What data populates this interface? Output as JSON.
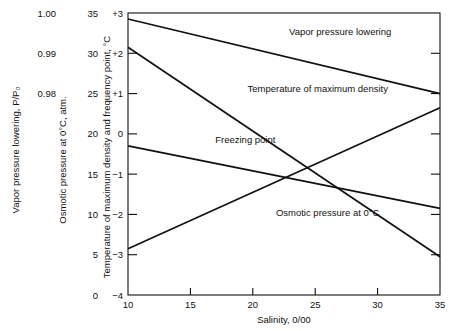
{
  "chart_data": {
    "type": "line",
    "title": "",
    "xlabel": "Salinity, 0/00",
    "xlim": [
      10,
      35
    ],
    "xticks": [
      10,
      15,
      20,
      25,
      30,
      35
    ],
    "grid": false,
    "legend_position": "inline-labels",
    "x": [
      10,
      35
    ],
    "axes": [
      {
        "id": "vapor-pressure-axis",
        "label": "Vapor pressure lowering, P/P₀",
        "ticks": [
          "1.00",
          "0.99",
          "0.98"
        ],
        "tick_values": [
          1.0,
          0.99,
          0.98
        ],
        "lim": [
          1.005,
          0.9765
        ]
      },
      {
        "id": "osmotic-pressure-axis",
        "label": "Osmotic pressure at 0°C, atm.",
        "ticks": [
          "35",
          "30",
          "25",
          "20",
          "15",
          "10",
          "5",
          "0"
        ],
        "tick_values": [
          35,
          30,
          25,
          20,
          15,
          10,
          5,
          0
        ],
        "lim": [
          35,
          0
        ]
      },
      {
        "id": "temperature-axis",
        "label": "Temperature of maximum density and frequency point, °C",
        "ticks": [
          "+3",
          "+2",
          "+1",
          "0",
          "−1",
          "−2",
          "−3",
          "−4"
        ],
        "tick_values": [
          3,
          2,
          1,
          0,
          -1,
          -2,
          -3,
          -4
        ],
        "lim": [
          3,
          -4
        ]
      }
    ],
    "series": [
      {
        "name": "Vapor pressure lowering",
        "label": "Vapor pressure lowering",
        "values": [
          2.85,
          1.0
        ],
        "label_x": 27.0,
        "label_y": 2.45,
        "color": "#111111"
      },
      {
        "name": "Temperature of maximum density",
        "label": "Temperature of maximum density",
        "values": [
          2.15,
          -3.05
        ],
        "label_x": 25.2,
        "label_y": 1.05,
        "color": "#111111"
      },
      {
        "name": "Freezing point",
        "label": "Freezing point",
        "values": [
          -0.3,
          -1.85
        ],
        "label_x": 19.4,
        "label_y": -0.23,
        "color": "#111111"
      },
      {
        "name": "Osmotic pressure at 0°C",
        "label": "Osmotic pressure at 0°C",
        "values": [
          -2.85,
          0.65
        ],
        "label_x": 26.0,
        "label_y": -2.05,
        "color": "#111111"
      }
    ]
  }
}
